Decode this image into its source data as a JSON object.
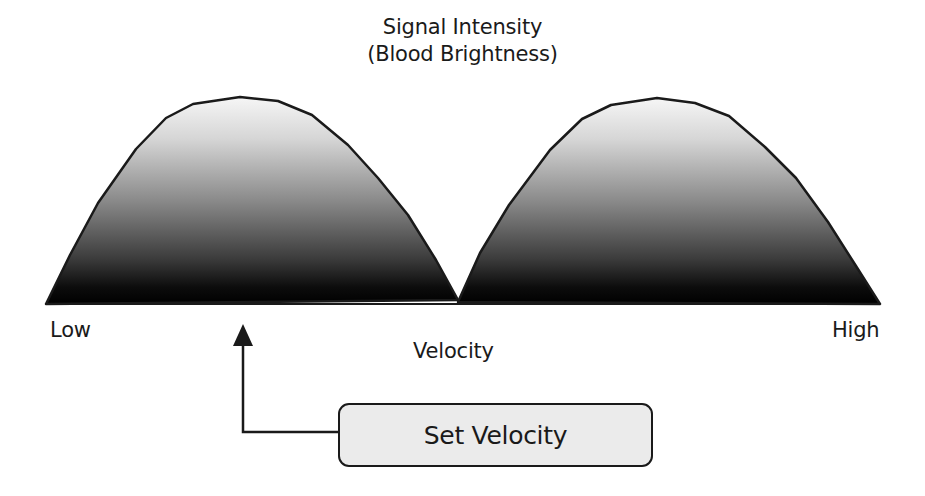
{
  "title": {
    "line1": "Signal Intensity",
    "line2": "(Blood Brightness)"
  },
  "axis": {
    "low_label": "Low",
    "high_label": "High",
    "x_label": "Velocity"
  },
  "callout": {
    "label": "Set Velocity",
    "points_to": "left lobe peak (low velocity)"
  },
  "colors": {
    "stroke": "#1a1a1a",
    "fill_top": "#f4f4f4",
    "fill_bottom": "#000000",
    "box_fill": "#ebebeb",
    "background": "#ffffff"
  },
  "shapes": {
    "left_lobe": {
      "x_start": 46,
      "x_peak": 240,
      "x_end": 458,
      "peak_y": 97
    },
    "right_lobe": {
      "x_start": 458,
      "x_peak": 657,
      "x_end": 880,
      "peak_y": 98
    },
    "baseline_y": 304
  }
}
